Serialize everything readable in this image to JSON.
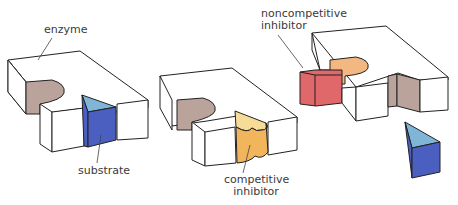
{
  "labels": {
    "enzyme": "enzyme",
    "substrate": "substrate",
    "competitive_1": "competitive",
    "competitive_2": "inhibitor",
    "noncompetitive_1": "noncompetitive",
    "noncompetitive_2": "inhibitor"
  },
  "colors": {
    "outline": "#222222",
    "active_site": "#b9a39b",
    "substrate_top": "#7fb6d8",
    "substrate_front": "#4a5fbf",
    "competitive_top": "#f6dc96",
    "competitive_front": "#f1b65c",
    "noncomp_top": "#f3b882",
    "noncomp_front": "#e0676a"
  }
}
